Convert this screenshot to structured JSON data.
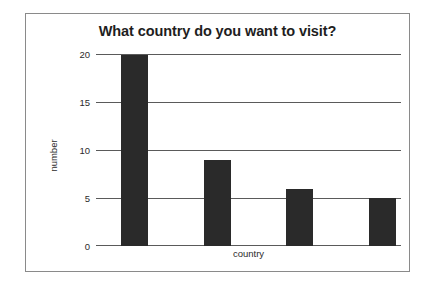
{
  "chart_data": {
    "type": "bar",
    "title": "What country do you want to visit?",
    "xlabel": "country",
    "ylabel": "number",
    "categories": [
      "",
      "",
      "",
      ""
    ],
    "values": [
      20,
      9,
      6,
      5
    ],
    "ylim": [
      0,
      20
    ],
    "yticks": [
      0,
      5,
      10,
      15,
      20
    ],
    "ytick_labels": [
      "0",
      "5",
      "10",
      "15",
      "20"
    ],
    "grid": true,
    "legend": false,
    "bar_color": "#2a2a2a",
    "gridline_color": "#5a5a5a",
    "background_color": "#ffffff",
    "border_color": "#8a8a8a"
  }
}
